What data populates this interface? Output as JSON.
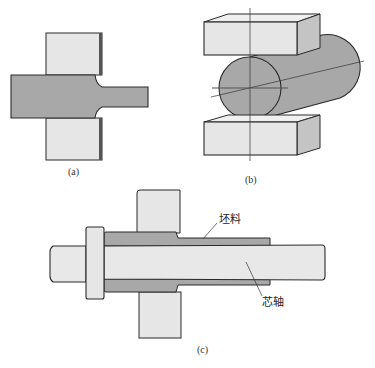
{
  "figure": {
    "panels": [
      {
        "id": "a",
        "caption": "(a)",
        "description": "Cross-section of a bar being necked between two flat dies"
      },
      {
        "id": "b",
        "caption": "(b)",
        "description": "Round cylindrical workpiece compressed between upper and lower flat dies, with center lines"
      },
      {
        "id": "c",
        "caption": "(c)",
        "description": "Hollow blank on a mandrel being drawn between dies"
      }
    ],
    "labels": {
      "blank": "坯料",
      "mandrel": "芯轴"
    },
    "colors": {
      "die_fill": "#e6e6e6",
      "die_side": "#c4c4c4",
      "workpiece_fill": "#a8a8a8",
      "mandrel_fill": "#e8e8e8",
      "outline": "#2a2a2a"
    }
  }
}
